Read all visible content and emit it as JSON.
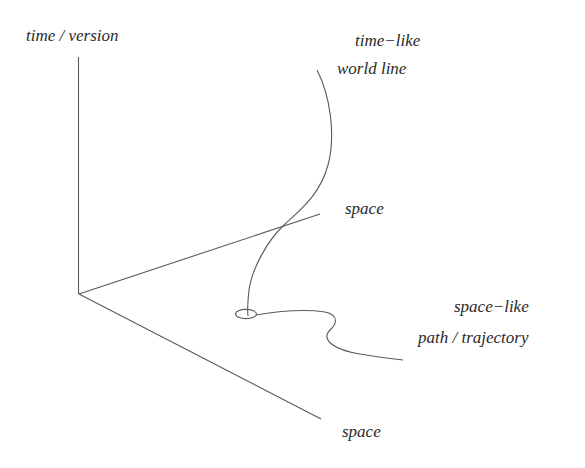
{
  "diagram": {
    "type": "3d-axes-sketch",
    "axes": {
      "vertical_label": "time / version",
      "back_horizontal_label": "space",
      "front_horizontal_label": "space"
    },
    "curves": {
      "world_line": {
        "label_line1": "time−like",
        "label_line2": "world line"
      },
      "trajectory": {
        "label_line1": "space−like",
        "label_line2": "path / trajectory"
      }
    },
    "colors": {
      "background": "#ffffff",
      "stroke": "#5a5a5a",
      "text": "#2a2a2a"
    }
  }
}
